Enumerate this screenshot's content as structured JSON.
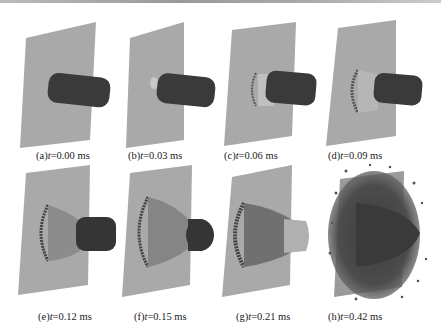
{
  "figure": {
    "panels": [
      {
        "id": "a",
        "label": "(a)",
        "var": "t",
        "value": "=0.00 ms"
      },
      {
        "id": "b",
        "label": "(b)",
        "var": "t",
        "value": "=0.03 ms"
      },
      {
        "id": "c",
        "label": "(c)",
        "var": "t",
        "value": "=0.06 ms"
      },
      {
        "id": "d",
        "label": "(d)",
        "var": "t",
        "value": "=0.09 ms"
      },
      {
        "id": "e",
        "label": "(e)",
        "var": "t",
        "value": "=0.12 ms"
      },
      {
        "id": "f",
        "label": "(f)",
        "var": "t",
        "value": "=0.15 ms"
      },
      {
        "id": "g",
        "label": "(g)",
        "var": "t",
        "value": "=0.21 ms"
      },
      {
        "id": "h",
        "label": "(h)",
        "var": "t",
        "value": "=0.42 ms"
      }
    ],
    "colors": {
      "plate": "#a8a8a8",
      "projectile": "#3a3a3a",
      "debris": "#4a4a4a"
    }
  }
}
